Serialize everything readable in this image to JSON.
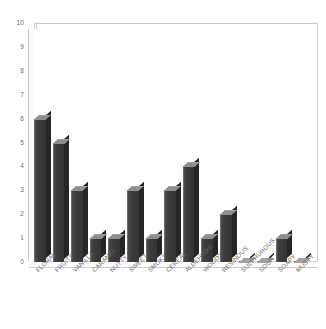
{
  "chart_data": {
    "type": "bar",
    "title": "",
    "subtitle": "",
    "xlabel": "",
    "ylabel": "",
    "ylim": [
      0,
      10
    ],
    "ytick_labels": [
      "10",
      "9",
      "8",
      "7",
      "6",
      "5",
      "4",
      "3",
      "2",
      "1",
      "0"
    ],
    "yticks": [
      10,
      9,
      8,
      7,
      6,
      5,
      4,
      3,
      2,
      1,
      0
    ],
    "grid": false,
    "legend": false,
    "legend_position": "none",
    "bar_color": "#3c3c3c",
    "bar_top_color": "#8e8e8e",
    "bar_side_color": "#262626",
    "background_color": "#ffffff",
    "axis_color": "#c8c8c8",
    "tick_label_color": "#6a6a6a",
    "categories": [
      "FLORAL",
      "FRUITY",
      "VANILLA",
      "CARAMEL",
      "NUTTY",
      "SWEET",
      "SMOKY",
      "CEREAL",
      "ALDEHYDIC",
      "WOODY",
      "RESINOUS",
      "SULPHUROUS",
      "SOUR",
      "SOAPY",
      "MUSTY"
    ],
    "values": [
      6,
      5,
      3,
      1,
      1,
      3,
      1,
      3,
      4,
      1,
      2,
      0,
      0,
      1,
      0
    ]
  }
}
